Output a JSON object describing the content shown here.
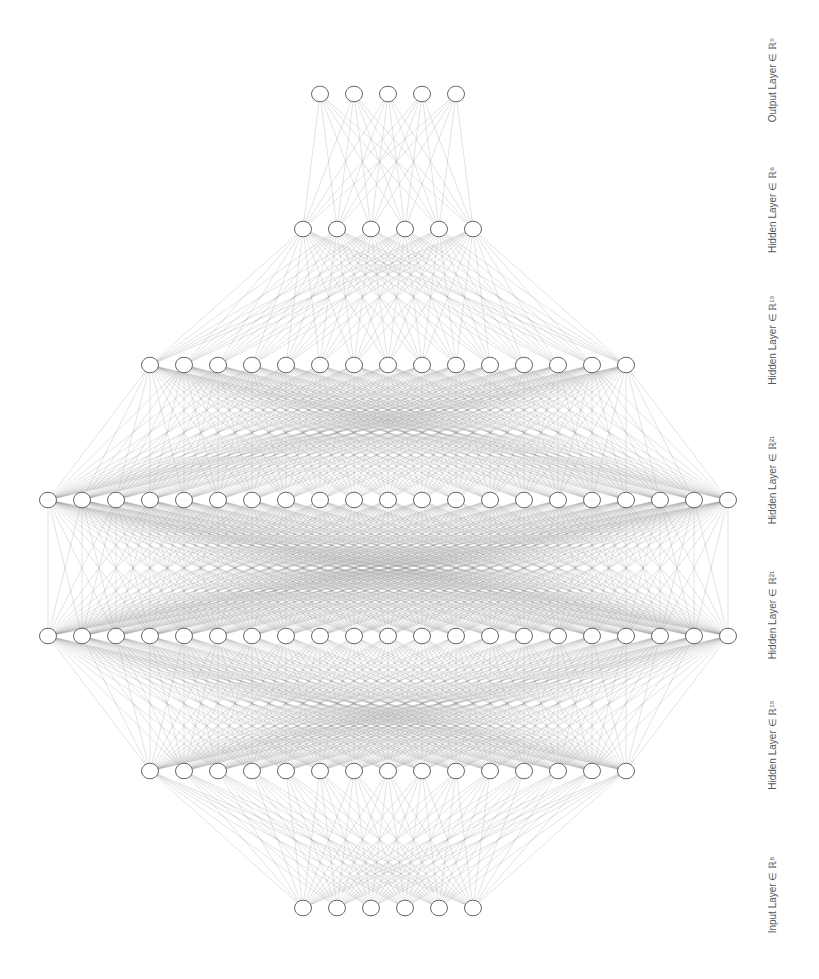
{
  "diagram": {
    "type": "neural-network",
    "orientation": "bottom-to-top",
    "node_spacing": 34,
    "node_radius": 8.5,
    "center_x": 388,
    "colors": {
      "edge": "#9a9a9a",
      "node_stroke": "#666666",
      "node_fill": "#ffffff",
      "label": "#555555"
    },
    "layers": [
      {
        "name": "input-layer",
        "label": "Input Layer ∈ ℝ⁶",
        "size": 6,
        "y": 908,
        "label_y": 895
      },
      {
        "name": "hidden-layer-1",
        "label": "Hidden Layer ∈ ℝ¹⁵",
        "size": 15,
        "y": 771,
        "label_y": 745
      },
      {
        "name": "hidden-layer-2",
        "label": "Hidden Layer ∈ ℝ²¹",
        "size": 21,
        "y": 636,
        "label_y": 615
      },
      {
        "name": "hidden-layer-3",
        "label": "Hidden Layer ∈ ℝ²¹",
        "size": 21,
        "y": 500,
        "label_y": 480
      },
      {
        "name": "hidden-layer-4",
        "label": "Hidden Layer ∈ ℝ¹⁵",
        "size": 15,
        "y": 365,
        "label_y": 340
      },
      {
        "name": "hidden-layer-5",
        "label": "Hidden Layer ∈ ℝ⁶",
        "size": 6,
        "y": 229,
        "label_y": 210
      },
      {
        "name": "output-layer",
        "label": "Output Layer ∈ ℝ⁵",
        "size": 5,
        "y": 94,
        "label_y": 80
      }
    ],
    "label_x": 772
  }
}
